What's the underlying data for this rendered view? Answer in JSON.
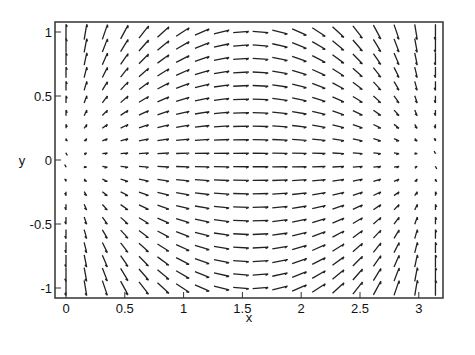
{
  "chart_data": {
    "type": "vector_field",
    "title": "",
    "xlabel": "x",
    "ylabel": "y",
    "xlim": [
      -0.08,
      3.22
    ],
    "ylim": [
      -1.08,
      1.08
    ],
    "xticks": [
      0,
      0.5,
      1,
      1.5,
      2,
      2.5,
      3
    ],
    "xtick_labels": [
      "0",
      "0.5",
      "1",
      "1.5",
      "2",
      "2.5",
      "3"
    ],
    "yticks": [
      1,
      0.5,
      0,
      -0.5,
      -1
    ],
    "ytick_labels": [
      "1",
      "0.5",
      "0",
      "-0.5",
      "-1"
    ],
    "grid": false,
    "field": "(sin(x), y*cos(x))",
    "grid_points": {
      "nx": 20,
      "ny": 20,
      "x_range": [
        0,
        3.14159
      ],
      "y_range": [
        -1,
        1
      ]
    },
    "arrow_color": "#222222"
  }
}
